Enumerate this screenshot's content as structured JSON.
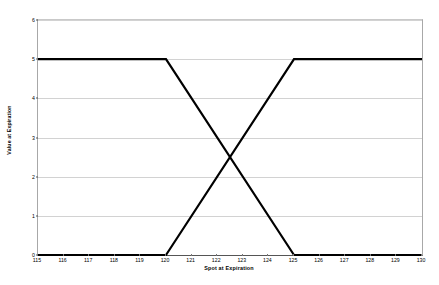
{
  "chart_data": {
    "type": "line",
    "title": "",
    "xlabel": "Spot at Expiration",
    "ylabel": "Value at Expiration",
    "xlim": [
      115,
      130
    ],
    "ylim": [
      0,
      6
    ],
    "grid": true,
    "legend": "none",
    "x_ticks": [
      115,
      116,
      117,
      118,
      119,
      120,
      121,
      122,
      123,
      124,
      125,
      126,
      127,
      128,
      129,
      130
    ],
    "y_ticks": [
      0,
      1,
      2,
      3,
      4,
      5,
      6
    ],
    "x_tick_labels": [
      "115",
      "116",
      "117",
      "118",
      "119",
      "120",
      "121",
      "122",
      "123",
      "124",
      "125",
      "126",
      "127",
      "128",
      "129",
      "130"
    ],
    "y_tick_labels": [
      "0",
      "1",
      "2",
      "3",
      "4",
      "5",
      "6"
    ],
    "line_color": "#000000",
    "line_width": 2.2,
    "grid_color": "#d2d2d2",
    "axis_color": "#555555",
    "series": [
      {
        "name": "descending-payoff",
        "x": [
          115,
          120,
          125,
          130
        ],
        "values": [
          5,
          5,
          0,
          0
        ]
      },
      {
        "name": "ascending-payoff",
        "x": [
          115,
          120,
          125,
          130
        ],
        "values": [
          0,
          0,
          5,
          5
        ]
      }
    ],
    "annotations": {
      "crossing_point": {
        "x": 122.5,
        "y": 2.5
      }
    }
  }
}
